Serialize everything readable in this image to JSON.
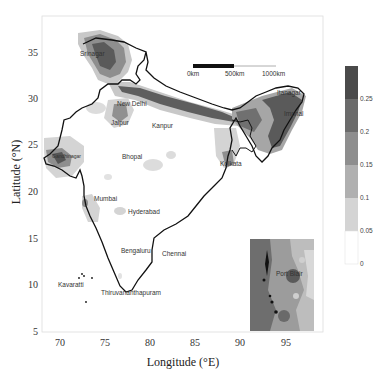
{
  "map": {
    "xlabel": "Longitude (°E)",
    "ylabel": "Latitude (°N)",
    "x_ticks": [
      {
        "label": "70",
        "x": 60
      },
      {
        "label": "75",
        "x": 105
      },
      {
        "label": "80",
        "x": 150
      },
      {
        "label": "85",
        "x": 195
      },
      {
        "label": "90",
        "x": 240
      },
      {
        "label": "95",
        "x": 286
      }
    ],
    "y_ticks": [
      {
        "label": "35",
        "y": 53
      },
      {
        "label": "30",
        "y": 99
      },
      {
        "label": "25",
        "y": 145
      },
      {
        "label": "20",
        "y": 192
      },
      {
        "label": "15",
        "y": 239
      },
      {
        "label": "10",
        "y": 285
      },
      {
        "label": "5",
        "y": 332
      }
    ],
    "scale_bar": {
      "labels": [
        "0km",
        "500km",
        "1000km"
      ]
    },
    "cities": [
      {
        "name": "Srinagar",
        "x": 80,
        "y": 53
      },
      {
        "name": "New Delhi",
        "x": 118,
        "y": 104
      },
      {
        "name": "Jaipur",
        "x": 110,
        "y": 123
      },
      {
        "name": "Kanpur",
        "x": 152,
        "y": 126
      },
      {
        "name": "Itanagar",
        "x": 276,
        "y": 94
      },
      {
        "name": "Imphal",
        "x": 280,
        "y": 115
      },
      {
        "name": "Kolkata",
        "x": 228,
        "y": 165
      },
      {
        "name": "Bhopal",
        "x": 122,
        "y": 156
      },
      {
        "name": "Gandhinagar",
        "x": 52,
        "y": 157
      },
      {
        "name": "Mumbai",
        "x": 94,
        "y": 198
      },
      {
        "name": "Hyderabad",
        "x": 128,
        "y": 212
      },
      {
        "name": "Bengaluru",
        "x": 121,
        "y": 251
      },
      {
        "name": "Chennai",
        "x": 162,
        "y": 254
      },
      {
        "name": "Kavaratti",
        "x": 58,
        "y": 285
      },
      {
        "name": "Thiruvananthapuram",
        "x": 101,
        "y": 293
      },
      {
        "name": "Port Blair",
        "x": 276,
        "y": 274
      }
    ]
  },
  "colorbar": {
    "ticks": [
      "0.25",
      "0.2",
      "0.15",
      "0.1",
      "0.05",
      "0"
    ],
    "levels": [
      {
        "range": "0.25-0.3",
        "color": "#4a4a4a"
      },
      {
        "range": "0.2-0.25",
        "color": "#6b6b6b"
      },
      {
        "range": "0.15-0.2",
        "color": "#8e8e8e"
      },
      {
        "range": "0.1-0.15",
        "color": "#b0b0b0"
      },
      {
        "range": "0.05-0.1",
        "color": "#d4d4d4"
      },
      {
        "range": "0-0.05",
        "color": "#ffffff"
      }
    ]
  }
}
